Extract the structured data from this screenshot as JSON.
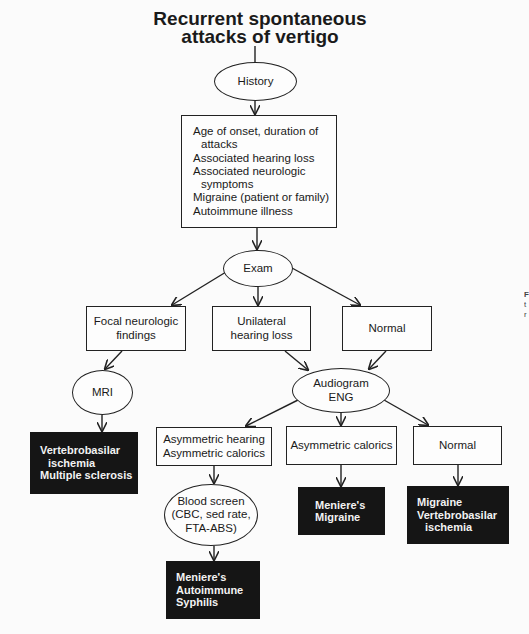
{
  "title": {
    "line1": "Recurrent spontaneous",
    "line2": "attacks of vertigo"
  },
  "nodes": {
    "history": {
      "label": "History"
    },
    "history_items": {
      "lines": [
        "Age of onset, duration of",
        "attacks",
        "Associated hearing loss",
        "Associated neurologic",
        "symptoms",
        "Migraine (patient or family)",
        "Autoimmune illness"
      ]
    },
    "exam": {
      "label": "Exam"
    },
    "focal": {
      "lines": [
        "Focal neurologic",
        "findings"
      ]
    },
    "unilateral": {
      "lines": [
        "Unilateral",
        "hearing loss"
      ]
    },
    "normal_exam": {
      "label": "Normal"
    },
    "mri": {
      "label": "MRI"
    },
    "mri_dx": {
      "lines": [
        "Vertebrobasilar",
        "ischemia",
        "Multiple sclerosis"
      ]
    },
    "audiogram": {
      "lines": [
        "Audiogram",
        "ENG"
      ]
    },
    "asym_both": {
      "lines": [
        "Asymmetric hearing",
        "Asymmetric calorics"
      ]
    },
    "asym_calorics": {
      "label": "Asymmetric calorics"
    },
    "normal_audio": {
      "label": "Normal"
    },
    "blood": {
      "lines": [
        "Blood screen",
        "(CBC, sed rate,",
        "FTA-ABS)"
      ]
    },
    "blood_dx": {
      "lines": [
        "Meniere's",
        "Autoimmune",
        "Syphilis"
      ]
    },
    "calorics_dx": {
      "lines": [
        "Meniere's",
        "Migraine"
      ]
    },
    "normal_dx": {
      "lines": [
        "Migraine",
        "Vertebrobasilar",
        "ischemia"
      ]
    }
  },
  "edge_fragment": {
    "lines": [
      "F",
      "t",
      "r"
    ]
  },
  "colors": {
    "line": "#222222",
    "dark_box": "#151515",
    "dark_text": "#f2f2f2",
    "background": "#fbfbfb"
  }
}
